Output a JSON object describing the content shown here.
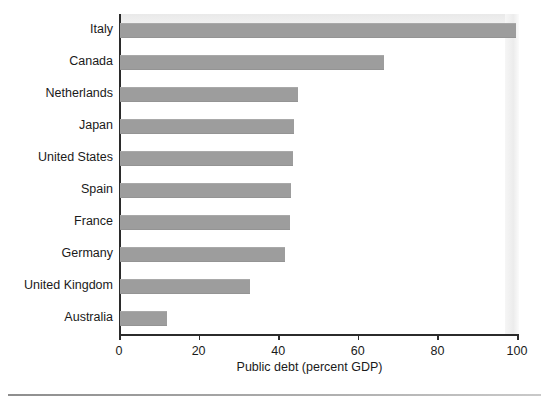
{
  "chart_data": {
    "type": "bar",
    "orientation": "horizontal",
    "title": "",
    "subtitle": "",
    "xlabel": "Public debt (percent GDP)",
    "ylabel": "",
    "xlim": [
      0,
      100
    ],
    "xticks": [
      0,
      20,
      40,
      60,
      80,
      100
    ],
    "xticklabels": [
      "0",
      "20",
      "40",
      "60",
      "80",
      "100"
    ],
    "grid": false,
    "legend": null,
    "categories": [
      "Italy",
      "Canada",
      "Netherlands",
      "Japan",
      "United States",
      "Spain",
      "France",
      "Germany",
      "United Kingdom",
      "Australia"
    ],
    "values": [
      99.5,
      66.4,
      44.8,
      43.6,
      43.5,
      43.0,
      42.7,
      41.5,
      32.7,
      11.7
    ],
    "bar_color": "#9d9d9d",
    "axis_color": "#2b2b2b"
  },
  "axis": {
    "x_title": "Public debt (percent GDP)"
  }
}
